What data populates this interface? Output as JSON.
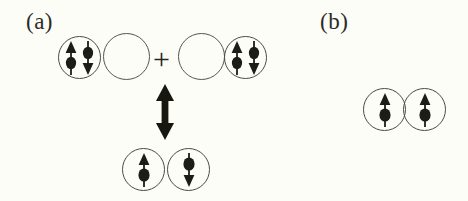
{
  "figure": {
    "background_color": "#fdfdf8",
    "ink_color": "#26261f",
    "outline_color": "#4a4a46",
    "width": 468,
    "height": 201
  },
  "panels": [
    {
      "id": "a",
      "label": "(a)",
      "description": "Resonance between doubly occupied and singly occupied orbital configurations",
      "top_row": {
        "left_pair": {
          "orbitals": [
            {
              "name": "orbital-doubly-occupied-left",
              "occupancy": "double",
              "spins": [
                "up",
                "down"
              ]
            },
            {
              "name": "orbital-empty-left",
              "occupancy": "empty",
              "spins": []
            }
          ]
        },
        "operator": "+",
        "right_pair": {
          "orbitals": [
            {
              "name": "orbital-empty-right",
              "occupancy": "empty",
              "spins": []
            },
            {
              "name": "orbital-doubly-occupied-right",
              "occupancy": "double",
              "spins": [
                "up",
                "down"
              ]
            }
          ]
        }
      },
      "connector": {
        "name": "resonance-arrow",
        "type": "double-headed-vertical-arrow"
      },
      "bottom_row": {
        "orbitals": [
          {
            "name": "orbital-single-up",
            "occupancy": "single",
            "spins": [
              "up"
            ]
          },
          {
            "name": "orbital-single-down",
            "occupancy": "single",
            "spins": [
              "down"
            ]
          }
        ]
      }
    },
    {
      "id": "b",
      "label": "(b)",
      "description": "Two singly occupied orbitals with parallel spins",
      "row": {
        "orbitals": [
          {
            "name": "orbital-parallel-up-left",
            "occupancy": "single",
            "spins": [
              "up"
            ]
          },
          {
            "name": "orbital-parallel-up-right",
            "occupancy": "single",
            "spins": [
              "up"
            ]
          }
        ]
      }
    }
  ],
  "glyphs": {
    "spin_up": "spin-up-arrow-icon",
    "spin_down": "spin-down-arrow-icon",
    "plus": "+",
    "resonance": "double-arrow-icon"
  }
}
